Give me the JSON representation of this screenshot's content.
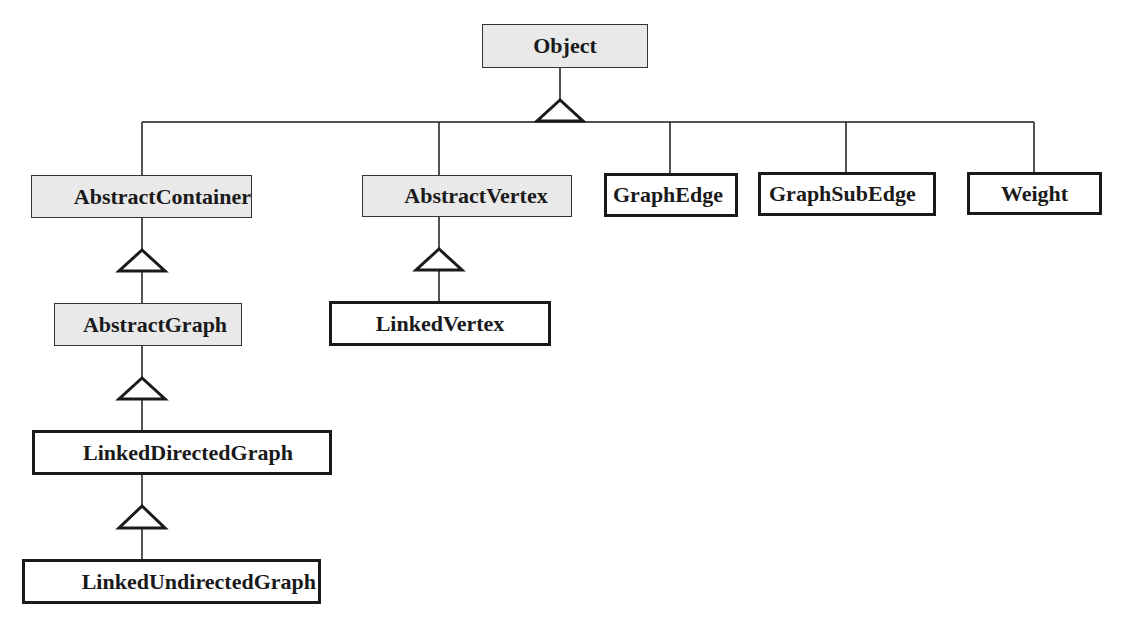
{
  "diagram": {
    "type": "UML class hierarchy",
    "colors": {
      "abstract_fill": "#e9e9e9",
      "concrete_fill": "#ffffff",
      "line": "#1a1a1a"
    },
    "classes": {
      "object": {
        "label": "Object",
        "kind": "abstract"
      },
      "abstract_container": {
        "label": "AbstractContainer",
        "kind": "abstract"
      },
      "abstract_vertex": {
        "label": "AbstractVertex",
        "kind": "abstract"
      },
      "graph_edge": {
        "label": "GraphEdge",
        "kind": "concrete"
      },
      "graph_sub_edge": {
        "label": "GraphSubEdge",
        "kind": "concrete"
      },
      "weight": {
        "label": "Weight",
        "kind": "concrete"
      },
      "abstract_graph": {
        "label": "AbstractGraph",
        "kind": "abstract"
      },
      "linked_vertex": {
        "label": "LinkedVertex",
        "kind": "concrete"
      },
      "linked_directed_graph": {
        "label": "LinkedDirectedGraph",
        "kind": "concrete"
      },
      "linked_undirected_graph": {
        "label": "LinkedUndirectedGraph",
        "kind": "concrete"
      }
    },
    "inheritance": [
      {
        "child": "AbstractContainer",
        "parent": "Object"
      },
      {
        "child": "AbstractVertex",
        "parent": "Object"
      },
      {
        "child": "GraphEdge",
        "parent": "Object"
      },
      {
        "child": "GraphSubEdge",
        "parent": "Object"
      },
      {
        "child": "Weight",
        "parent": "Object"
      },
      {
        "child": "AbstractGraph",
        "parent": "AbstractContainer"
      },
      {
        "child": "LinkedVertex",
        "parent": "AbstractVertex"
      },
      {
        "child": "LinkedDirectedGraph",
        "parent": "AbstractGraph"
      },
      {
        "child": "LinkedUndirectedGraph",
        "parent": "LinkedDirectedGraph"
      }
    ]
  }
}
